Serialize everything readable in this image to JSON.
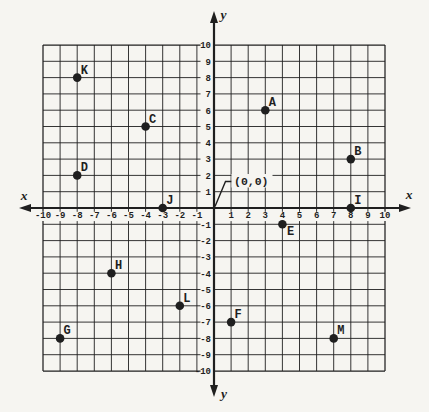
{
  "figure": {
    "description_label": "coordinate-plane-figure",
    "origin_label": "(0,0)"
  },
  "chart_data": {
    "type": "scatter",
    "title": "",
    "xlabel": "x",
    "ylabel": "y",
    "xlim": [
      -10,
      10
    ],
    "ylim": [
      -10,
      10
    ],
    "grid": true,
    "axis_end_labels": {
      "x_left": "x",
      "x_right": "x",
      "y_top": "y",
      "y_bottom": "y"
    },
    "x_tick_labels": [
      "-10",
      "-9",
      "-8",
      "-7",
      "-6",
      "-5",
      "-4",
      "-3",
      "-2",
      "-1",
      "1",
      "2",
      "3",
      "4",
      "5",
      "6",
      "7",
      "8",
      "9",
      "10"
    ],
    "y_tick_labels": [
      "10",
      "9",
      "8",
      "7",
      "6",
      "5",
      "4",
      "3",
      "2",
      "1",
      "-1",
      "-2",
      "-3",
      "-4",
      "-5",
      "-6",
      "-7",
      "-8",
      "-9",
      "-10"
    ],
    "origin_annotation": "(0,0)",
    "points": [
      {
        "label": "A",
        "x": 3,
        "y": 6,
        "label_side": "above-right"
      },
      {
        "label": "B",
        "x": 8,
        "y": 3,
        "label_side": "above-right"
      },
      {
        "label": "C",
        "x": -4,
        "y": 5,
        "label_side": "above-right"
      },
      {
        "label": "D",
        "x": -8,
        "y": 2,
        "label_side": "above-right"
      },
      {
        "label": "E",
        "x": 4,
        "y": -1,
        "label_side": "below-right"
      },
      {
        "label": "F",
        "x": 1,
        "y": -7,
        "label_side": "above-right"
      },
      {
        "label": "G",
        "x": -9,
        "y": -8,
        "label_side": "above-right"
      },
      {
        "label": "H",
        "x": -6,
        "y": -4,
        "label_side": "above-right"
      },
      {
        "label": "I",
        "x": 8,
        "y": 0,
        "label_side": "above-right"
      },
      {
        "label": "J",
        "x": -3,
        "y": 0,
        "label_side": "above-right"
      },
      {
        "label": "K",
        "x": -8,
        "y": 8,
        "label_side": "above-right"
      },
      {
        "label": "L",
        "x": -2,
        "y": -6,
        "label_side": "above-right"
      },
      {
        "label": "M",
        "x": 7,
        "y": -8,
        "label_side": "above-right"
      }
    ],
    "colors": {
      "ink": "#1f1f1f",
      "paper": "#f6f5f1"
    }
  }
}
